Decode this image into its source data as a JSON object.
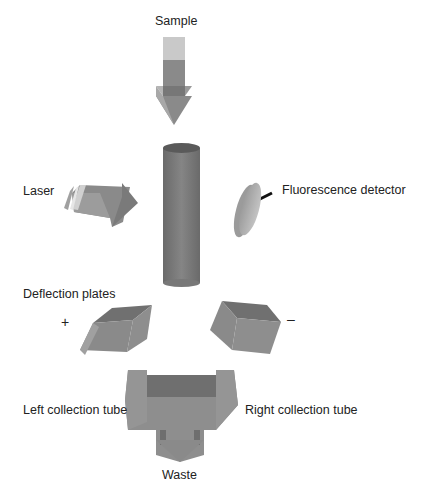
{
  "labels": {
    "sample": "Sample",
    "laser": "Laser",
    "detector": "Fluorescence detector",
    "deflection": "Deflection plates",
    "plus": "+",
    "minus": "–",
    "left_tube": "Left collection tube",
    "right_tube": "Right collection tube",
    "waste": "Waste"
  },
  "colors": {
    "light": "#bdbdbd",
    "mid": "#8c8c8c",
    "dark": "#6e6e6e",
    "darkest": "#555555"
  }
}
